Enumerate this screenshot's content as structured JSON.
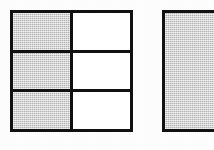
{
  "document": {
    "kind": "shaded-region-figures",
    "figure_count": 2,
    "background_color": "#fdfdfd",
    "line_color": "#111111",
    "shade_color": "#c9c9c9",
    "unshaded_color": "#ffffff"
  },
  "figures": [
    {
      "id": "figure-one",
      "shape": "square",
      "columns": 2,
      "rows": 3,
      "total_cells": 6,
      "shaded_cells": 3,
      "fraction_shaded": "3/6",
      "shaded_column": "left",
      "cells": [
        {
          "row": 1,
          "column": 1,
          "state": "shaded"
        },
        {
          "row": 1,
          "column": 2,
          "state": "unshaded"
        },
        {
          "row": 2,
          "column": 1,
          "state": "shaded"
        },
        {
          "row": 2,
          "column": 2,
          "state": "unshaded"
        },
        {
          "row": 3,
          "column": 1,
          "state": "shaded"
        },
        {
          "row": 3,
          "column": 2,
          "state": "unshaded"
        }
      ]
    },
    {
      "id": "figure-two",
      "shape": "square",
      "columns": 1,
      "rows": 1,
      "total_cells": 1,
      "shaded_cells": 1,
      "fraction_shaded": "1/1",
      "clipped": "right-edge",
      "cells": [
        {
          "row": 1,
          "column": 1,
          "state": "shaded"
        }
      ]
    }
  ]
}
